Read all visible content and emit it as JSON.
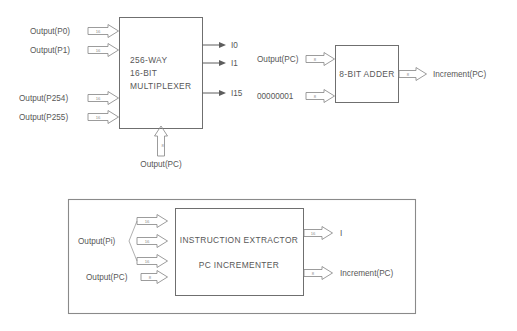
{
  "diagram": {
    "colors": {
      "background": "#ffffff",
      "box_stroke": "#6f6f6f",
      "arrow_stroke": "#8a8a8a",
      "text": "#575757",
      "bitwidth_text": "#8d8d8d"
    }
  },
  "multiplexer_section": {
    "block": {
      "name": "multiplexer-block",
      "line1": "256-WAY",
      "line2": "16-BIT",
      "line3": "MULTIPLEXER"
    },
    "inputs": [
      {
        "label": "Output(P0)",
        "bits": "16"
      },
      {
        "label": "Output(P1)",
        "bits": "16"
      },
      {
        "label": "Output(P254)",
        "bits": "16"
      },
      {
        "label": "Output(P255)",
        "bits": "16"
      }
    ],
    "select_input": {
      "label": "Output(PC)",
      "bits": "8"
    },
    "outputs": [
      {
        "label": "I0"
      },
      {
        "label": "I1"
      },
      {
        "label": "I15"
      }
    ]
  },
  "adder_section": {
    "block": {
      "name": "adder-block",
      "label": "8-BIT ADDER"
    },
    "inputs": [
      {
        "label": "Output(PC)",
        "bits": "8"
      },
      {
        "label": "00000001",
        "bits": "8"
      }
    ],
    "outputs": [
      {
        "label": "Increment(PC)",
        "bits": "8"
      }
    ]
  },
  "combined_section": {
    "block": {
      "name": "instruction-extractor-block",
      "line1": "INSTRUCTION EXTRACTOR",
      "line2": "PC INCREMENTER"
    },
    "bus_inputs": {
      "label": "Output(Pi)",
      "branches": [
        {
          "bits": "16"
        },
        {
          "bits": "16"
        },
        {
          "bits": "16"
        }
      ]
    },
    "pc_input": {
      "label": "Output(PC)",
      "bits": "8"
    },
    "outputs": [
      {
        "label": "I",
        "bits": "16"
      },
      {
        "label": "Increment(PC)",
        "bits": "8"
      }
    ]
  }
}
